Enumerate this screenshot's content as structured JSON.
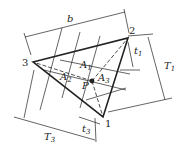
{
  "diagram": {
    "vertices": [
      {
        "id": "1",
        "label": "1",
        "x": 103,
        "y": 117
      },
      {
        "id": "2",
        "label": "2",
        "x": 128,
        "y": 38
      },
      {
        "id": "3",
        "label": "3",
        "x": 33,
        "y": 62
      }
    ],
    "point": {
      "label": "P",
      "x": 92,
      "y": 81
    },
    "areas": [
      {
        "label": "A",
        "sub": "1"
      },
      {
        "label": "A",
        "sub": "2"
      },
      {
        "label": "A",
        "sub": "3"
      }
    ],
    "dimensions": {
      "b": "b",
      "T1": {
        "label": "T",
        "sub": "1"
      },
      "T3": {
        "label": "T",
        "sub": "3"
      },
      "t1": {
        "label": "t",
        "sub": "1"
      },
      "t3": {
        "label": "t",
        "sub": "3"
      }
    },
    "colors": {
      "line": "#222222",
      "background": "#ffffff"
    }
  }
}
